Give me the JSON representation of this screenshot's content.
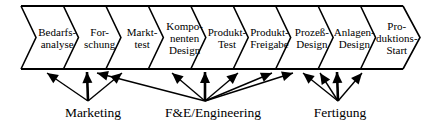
{
  "colors": {
    "background": "#ffffff",
    "ink": "#000000"
  },
  "process_chain": {
    "stages": [
      {
        "name": "Bedarfsanalyse",
        "lines": [
          "Bedarfs-",
          "analyse"
        ]
      },
      {
        "name": "Forschung",
        "lines": [
          "For-",
          "schung"
        ]
      },
      {
        "name": "Markttest",
        "lines": [
          "Markt-",
          "test"
        ]
      },
      {
        "name": "Komponenten-Design",
        "lines": [
          "Kompo-",
          "nenten",
          "Design"
        ]
      },
      {
        "name": "Produkt-Test",
        "lines": [
          "Produkt-",
          "Test"
        ]
      },
      {
        "name": "Produkt-Freigabe",
        "lines": [
          "Produkt-",
          "Freigabe"
        ]
      },
      {
        "name": "Prozess-Design",
        "lines": [
          "Prozeß-",
          "Design"
        ]
      },
      {
        "name": "Anlagen-Design",
        "lines": [
          "Anlagen-",
          "Design"
        ]
      },
      {
        "name": "Produktions-Start",
        "lines": [
          "Pro-",
          "duktions-",
          "Start"
        ]
      }
    ]
  },
  "functions": [
    {
      "label": "Marketing",
      "origin_x": 88,
      "label_x": 93,
      "arrow_targets_x": [
        47,
        87,
        122
      ]
    },
    {
      "label": "F&E/Engineering",
      "origin_x": 205,
      "label_x": 213,
      "arrow_targets_x": [
        97,
        172,
        205,
        238,
        272,
        293
      ]
    },
    {
      "label": "Fertigung",
      "origin_x": 338,
      "label_x": 340,
      "arrow_targets_x": [
        303,
        320,
        337,
        362
      ]
    }
  ]
}
